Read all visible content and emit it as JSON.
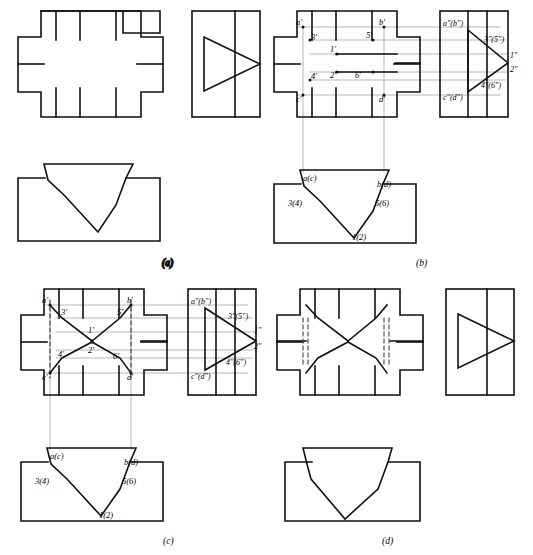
{
  "sheet": {
    "title": "Orthographic projection exercise — four alternative solutions",
    "width": 533,
    "height": 555,
    "background": "#ffffff",
    "line_color": "#111111",
    "projection_line_color": "#8a8a8a",
    "hidden_line_color": "#555555"
  },
  "panels": [
    {
      "id": "a",
      "caption": "(a)",
      "views": [
        "front-view",
        "right-side-view",
        "bottom-view"
      ],
      "front_view": {
        "outline": "cross",
        "tick_marks_top": 3,
        "tick_marks_bottom": 3,
        "tick_marks_left": 1,
        "tick_marks_right": 1
      },
      "right_side_view": {
        "outline": "rectangle",
        "inner": "triangle-pointing-right",
        "vertical_divider": 1
      },
      "bottom_view": {
        "outline": "rectangle-with-trapezoid-top",
        "inner": "v-notch-wedge"
      },
      "labels": []
    },
    {
      "id": "b",
      "caption": "(b)",
      "views": [
        "front-view",
        "right-side-view",
        "bottom-view"
      ],
      "front_view_labels": [
        "a'",
        "3'",
        "1'",
        "4'",
        "2'",
        "5'",
        "6'",
        "b'",
        "c'",
        "d'"
      ],
      "right_side_view_labels": [
        "a\"(b\")",
        "3\"(5\")",
        "1\"",
        "2\"",
        "4\"(6\")",
        "c\"(d\")"
      ],
      "bottom_view_labels": [
        "a(c)",
        "b(d)",
        "3(4)",
        "5(6)",
        "1(2)"
      ],
      "front_view": {
        "outline": "cross",
        "tick_marks_top": 3,
        "tick_marks_bottom": 3
      },
      "right_side_view": {
        "outline": "rectangle",
        "inner": "triangle-pointing-right"
      },
      "bottom_view": {
        "outline": "rectangle-with-trapezoid-top",
        "inner": "v-notch-wedge"
      }
    },
    {
      "id": "c",
      "caption": "(c)",
      "views": [
        "front-view",
        "right-side-view",
        "bottom-view"
      ],
      "front_view_labels": [
        "a'",
        "3'",
        "1'",
        "5'",
        "b'",
        "4'",
        "2'",
        "6'",
        "c'",
        "d'"
      ],
      "right_side_view_labels": [
        "a\"(b\")",
        "3\"(5\")",
        "1\"",
        "2\"",
        "4\"(6\")",
        "c\"(d\")"
      ],
      "bottom_view_labels": [
        "a(c)",
        "b(d)",
        "3(4)",
        "5(6)",
        "1(2)"
      ],
      "front_view": {
        "outline": "cross",
        "inner": "bowtie-notch",
        "hidden_lines": 2
      },
      "right_side_view": {
        "outline": "rectangle",
        "inner": "triangle-pointing-right"
      },
      "bottom_view": {
        "outline": "rectangle-with-trapezoid-top",
        "inner": "v-notch-wedge"
      }
    },
    {
      "id": "d",
      "caption": "(d)",
      "views": [
        "front-view",
        "right-side-view",
        "bottom-view"
      ],
      "front_view": {
        "outline": "cross",
        "inner": "bowtie-notch",
        "hidden_lines": 4
      },
      "right_side_view": {
        "outline": "rectangle",
        "inner": "triangle-pointing-right",
        "vertical_divider": 1
      },
      "bottom_view": {
        "outline": "rectangle-with-trapezoid-top",
        "inner": "v-notch-wedge"
      },
      "labels": []
    }
  ],
  "label_groups": {
    "primed_front": [
      "a'",
      "3'",
      "1'",
      "4'",
      "2'",
      "5'",
      "6'",
      "b'",
      "c'",
      "d'"
    ],
    "double_primed_side": [
      "a\"(b\")",
      "3\"(5\")",
      "1\"",
      "2\"",
      "4\"(6\")",
      "c\"(d\")"
    ],
    "plain_bottom": [
      "a(c)",
      "b(d)",
      "3(4)",
      "5(6)",
      "1(2)"
    ]
  },
  "captions": {
    "a": "(a)",
    "b": "(b)",
    "c": "(c)",
    "d": "(d)"
  }
}
